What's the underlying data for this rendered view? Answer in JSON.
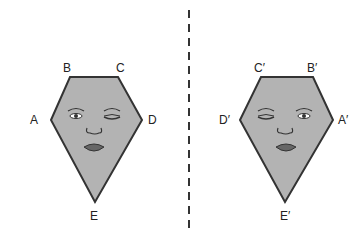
{
  "diagram": {
    "type": "reflection",
    "mirror_line": {
      "style": "dashed",
      "x": 189
    },
    "colors": {
      "fill": "#b3b3b3",
      "stroke": "#333333",
      "line": "#333333"
    },
    "original": {
      "vertices": [
        {
          "label": "A",
          "x": 51,
          "y": 120
        },
        {
          "label": "B",
          "x": 70,
          "y": 77
        },
        {
          "label": "C",
          "x": 118,
          "y": 77
        },
        {
          "label": "D",
          "x": 142,
          "y": 120
        },
        {
          "label": "E",
          "x": 95,
          "y": 202
        }
      ],
      "face": "left eye open, right eye closed"
    },
    "image": {
      "vertices": [
        {
          "label": "D′",
          "x": 240,
          "y": 120
        },
        {
          "label": "C′",
          "x": 261,
          "y": 77
        },
        {
          "label": "B′",
          "x": 313,
          "y": 77
        },
        {
          "label": "A′",
          "x": 333,
          "y": 120
        },
        {
          "label": "E′",
          "x": 285,
          "y": 202
        }
      ],
      "face": "left eye closed, right eye open"
    }
  }
}
